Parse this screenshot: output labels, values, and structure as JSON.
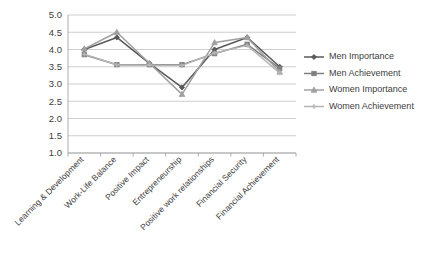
{
  "chart_data": {
    "type": "line",
    "title": "",
    "xlabel": "",
    "ylabel": "",
    "ylim": [
      1.0,
      5.0
    ],
    "ytick_step": 0.5,
    "ytick_labels": [
      "5.0",
      "4.5",
      "4.0",
      "3.5",
      "3.0",
      "2.5",
      "2.0",
      "1.5",
      "1.0"
    ],
    "grid": true,
    "legend_position": "right",
    "categories": [
      "Learning & Development",
      "Work-Life Balance",
      "Positive Impact",
      "Entrepreneurship",
      "Positive work relationships",
      "Financial Security",
      "Financial Achievement"
    ],
    "series": [
      {
        "name": "Men Importance",
        "color": "#595959",
        "marker": "diamond",
        "values": [
          4.0,
          4.35,
          3.6,
          2.9,
          4.0,
          4.35,
          3.5
        ]
      },
      {
        "name": "Men Achievement",
        "color": "#7f7f7f",
        "marker": "square",
        "values": [
          3.85,
          3.56,
          3.56,
          3.56,
          3.88,
          4.15,
          3.45
        ]
      },
      {
        "name": "Women Importance",
        "color": "#a0a0a0",
        "marker": "triangle",
        "values": [
          4.02,
          4.5,
          3.6,
          2.7,
          4.2,
          4.35,
          3.35
        ]
      },
      {
        "name": "Women Achievement",
        "color": "#b5b5b5",
        "marker": "cross",
        "values": [
          3.86,
          3.56,
          3.54,
          3.54,
          3.9,
          4.12,
          3.32
        ]
      }
    ]
  }
}
